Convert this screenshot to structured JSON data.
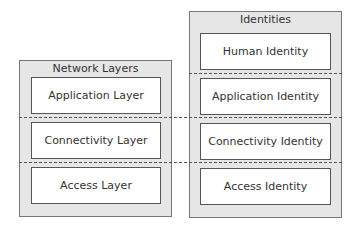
{
  "diagram": {
    "left_group": {
      "title": "Network Layers",
      "items": [
        "Application Layer",
        "Connectivity Layer",
        "Access Layer"
      ]
    },
    "right_group": {
      "title": "Identities",
      "items": [
        "Human Identity",
        "Application Identity",
        "Connectivity Identity",
        "Access Identity"
      ]
    }
  }
}
